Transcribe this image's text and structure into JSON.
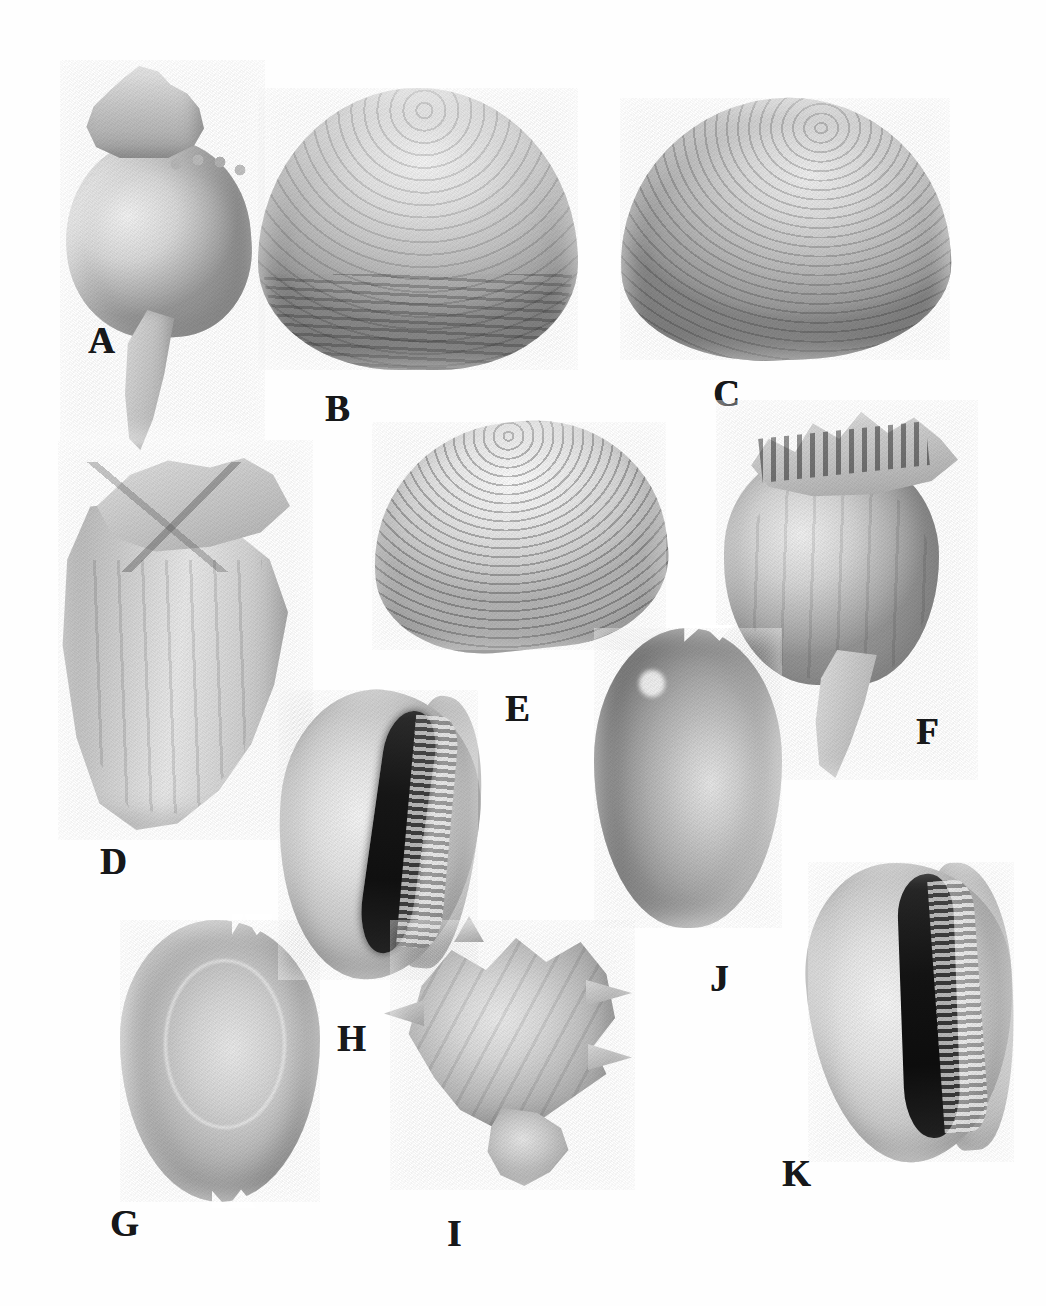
{
  "plate": {
    "title": "Mollusc shell specimen plate",
    "background_color": "#ffffff",
    "ink_color": "#17181a",
    "width": 1046,
    "height": 1306,
    "style": "grayscale halftone photographic plate",
    "specimen_count": 11
  },
  "specimens": [
    {
      "label": "A",
      "name": "fusiform-gastropod",
      "description": "Large fusiform gastropod (whelk) with pointed spire, nodular shoulder and long siphonal canal",
      "class": "Gastropoda",
      "label_x": 88,
      "label_y": 322
    },
    {
      "label": "B",
      "name": "smooth-bivalve-valve",
      "description": "Large ovate bivalve valve with fine concentric growth lines, darker toward ventral margin",
      "class": "Bivalvia",
      "label_x": 325,
      "label_y": 390
    },
    {
      "label": "C",
      "name": "concentric-bivalve-valve",
      "description": "Large bivalve valve with strong concentric sculpture, tilted to the left",
      "class": "Bivalvia",
      "label_x": 713,
      "label_y": 375
    },
    {
      "label": "D",
      "name": "knobbed-gastropod",
      "description": "Large knobbed gastropod seen in apertural view with shouldered spire and axial ribs",
      "class": "Gastropoda",
      "label_x": 100,
      "label_y": 843
    },
    {
      "label": "E",
      "name": "ribbed-venus-clam",
      "description": "Ribbed venus clam valve with closely spaced concentric ribs",
      "class": "Bivalvia",
      "label_x": 505,
      "label_y": 690
    },
    {
      "label": "F",
      "name": "knobbed-whelk",
      "description": "Knobbed whelk with spiny shoulder crown and tapering siphonal canal",
      "class": "Gastropoda",
      "label_x": 916,
      "label_y": 713
    },
    {
      "label": "G",
      "name": "cowrie-dorsal-view",
      "description": "Cowrie shell in dorsal view, smooth glossy surface with faint mantle line",
      "class": "Gastropoda",
      "label_x": 110,
      "label_y": 1205
    },
    {
      "label": "H",
      "name": "cowrie-ventral-view",
      "description": "Cowrie shell in ventral view showing dark narrow aperture flanked by denticulate teeth",
      "class": "Gastropoda",
      "label_x": 337,
      "label_y": 1020
    },
    {
      "label": "I",
      "name": "spiny-murex-fragment",
      "description": "Spiny murex-type gastropod fragment with projecting spines and eroded base",
      "class": "Gastropoda",
      "label_x": 447,
      "label_y": 1215
    },
    {
      "label": "J",
      "name": "cowrie-dorsal-dark",
      "description": "Darker cowrie shell in dorsal view with small apical notch and bright highlight",
      "class": "Gastropoda",
      "label_x": 710,
      "label_y": 960
    },
    {
      "label": "K",
      "name": "cowrie-ventral-view-2",
      "description": "Second cowrie shell in ventral view with long black aperture and toothed outer lip",
      "class": "Gastropoda",
      "label_x": 782,
      "label_y": 1155
    }
  ]
}
